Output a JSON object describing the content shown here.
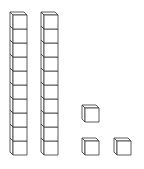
{
  "title": "Base-ten blocks",
  "colors": {
    "stroke": "#333333",
    "fill": "#ffffff",
    "background": "#ffffff"
  },
  "cube_size": 14,
  "depth": 3,
  "rods": [
    {
      "label": "ten-rod-1",
      "x": 13,
      "bottom": 155,
      "count": 10
    },
    {
      "label": "ten-rod-2",
      "x": 44,
      "bottom": 155,
      "count": 10
    }
  ],
  "units": [
    {
      "label": "unit-cube-1",
      "x": 85,
      "y": 108
    },
    {
      "label": "unit-cube-2",
      "x": 85,
      "y": 141
    },
    {
      "label": "unit-cube-3",
      "x": 117,
      "y": 141
    }
  ],
  "value": {
    "tens": 2,
    "ones": 3,
    "total": 23
  }
}
